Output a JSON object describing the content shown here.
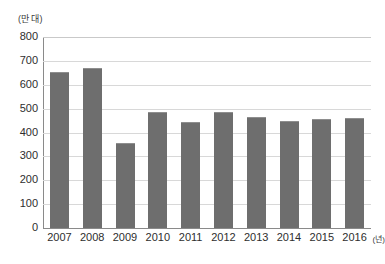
{
  "chart_data": {
    "type": "bar",
    "title": "",
    "subtitle": "",
    "xlabel": "(년)",
    "ylabel": "(만 대)",
    "categories": [
      "2007",
      "2008",
      "2009",
      "2010",
      "2011",
      "2012",
      "2013",
      "2014",
      "2015",
      "2016"
    ],
    "values": [
      655,
      672,
      355,
      485,
      443,
      485,
      465,
      447,
      455,
      460
    ],
    "ylim": [
      0,
      800
    ],
    "ytick_step": 100,
    "yticks": [
      "800",
      "700",
      "600",
      "500",
      "400",
      "300",
      "200",
      "100",
      "0"
    ],
    "grid": true,
    "legend": false,
    "legend_position": "none",
    "series_name": "",
    "bar_color": "#6e6e6e",
    "gridline_color": "#d8d8d8",
    "axis_color": "#8a8a8a",
    "background_color": "#ffffff",
    "source_note": ""
  },
  "annotations": {
    "y_unit_caption": "(만 대)",
    "x_unit_caption": "(년)"
  }
}
